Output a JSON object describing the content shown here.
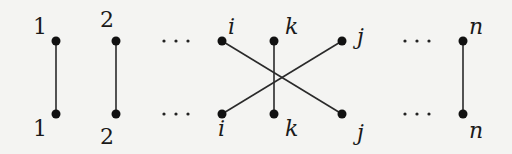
{
  "diagram": {
    "type": "permutation-diagram",
    "colors": {
      "background": "#f4f4f2",
      "ink": "#111111"
    },
    "top_row": [
      {
        "id": "t1",
        "label": "1",
        "x": 56
      },
      {
        "id": "t2",
        "label": "2",
        "x": 116
      },
      {
        "id": "ti",
        "label": "i",
        "x": 222
      },
      {
        "id": "tk",
        "label": "k",
        "x": 274
      },
      {
        "id": "tj",
        "label": "j",
        "x": 342
      },
      {
        "id": "tn",
        "label": "n",
        "x": 463
      }
    ],
    "bottom_row": [
      {
        "id": "b1",
        "label": "1",
        "x": 56
      },
      {
        "id": "b2",
        "label": "2",
        "x": 116
      },
      {
        "id": "bi",
        "label": "i",
        "x": 222
      },
      {
        "id": "bk",
        "label": "k",
        "x": 274
      },
      {
        "id": "bj",
        "label": "j",
        "x": 342
      },
      {
        "id": "bn",
        "label": "n",
        "x": 463
      }
    ],
    "edges": [
      {
        "from": "t1",
        "to": "b1"
      },
      {
        "from": "t2",
        "to": "b2"
      },
      {
        "from": "ti",
        "to": "bj"
      },
      {
        "from": "tk",
        "to": "bk"
      },
      {
        "from": "tj",
        "to": "bi"
      },
      {
        "from": "tn",
        "to": "bn"
      }
    ],
    "ellipsis": "⋯",
    "labels": {
      "top_1": "1",
      "top_2": "2",
      "top_i": "i",
      "top_k": "k",
      "top_j": "j",
      "top_n": "n",
      "bottom_1": "1",
      "bottom_2": "2",
      "bottom_i": "i",
      "bottom_k": "k",
      "bottom_j": "j",
      "bottom_n": "n"
    }
  }
}
